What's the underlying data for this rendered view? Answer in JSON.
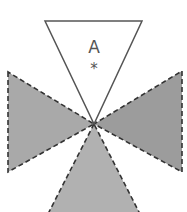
{
  "diagram": {
    "top_triangle": {
      "label": "A",
      "marker": "*",
      "fill": "#ffffff",
      "stroke": "#555555",
      "line_style": "solid"
    },
    "left_triangle": {
      "fill": "#a9a9a9",
      "stroke": "#333333",
      "line_style": "dashed"
    },
    "right_triangle": {
      "fill": "#9c9c9c",
      "stroke": "#333333",
      "line_style": "dashed"
    },
    "bottom_triangle": {
      "fill": "#b1b1b1",
      "stroke": "#333333",
      "line_style": "dashed"
    }
  }
}
